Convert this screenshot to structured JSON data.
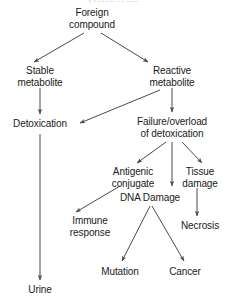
{
  "diagram": {
    "title_clipped": "Metabolism",
    "line_color": "#4a4a4a",
    "text_color": "#1a1a1a",
    "background": "#ffffff",
    "nodes": [
      {
        "id": "foreign-compound",
        "label": "Foreign\ncompound",
        "x": 92,
        "y": 18
      },
      {
        "id": "stable-metabolite",
        "label": "Stable\nmetabolite",
        "x": 40,
        "y": 76
      },
      {
        "id": "reactive-metabolite",
        "label": "Reactive\nmetabolite",
        "x": 172,
        "y": 76
      },
      {
        "id": "detoxication",
        "label": "Detoxication",
        "x": 40,
        "y": 124
      },
      {
        "id": "failure-overload",
        "label": "Failure/overload\nof detoxication",
        "x": 172,
        "y": 127
      },
      {
        "id": "antigenic-conjugate",
        "label": "Antigenic\nconjugate",
        "x": 133,
        "y": 177
      },
      {
        "id": "tissue-damage",
        "label": "Tissue\ndamage",
        "x": 200,
        "y": 177
      },
      {
        "id": "dna-damage",
        "label": "DNA Damage",
        "x": 150,
        "y": 198
      },
      {
        "id": "immune-response",
        "label": "Immune\nresponse",
        "x": 90,
        "y": 226
      },
      {
        "id": "necrosis",
        "label": "Necrosis",
        "x": 200,
        "y": 226
      },
      {
        "id": "mutation",
        "label": "Mutation",
        "x": 120,
        "y": 272
      },
      {
        "id": "cancer",
        "label": "Cancer",
        "x": 185,
        "y": 272
      },
      {
        "id": "urine",
        "label": "Urine",
        "x": 40,
        "y": 290
      }
    ],
    "edges": [
      {
        "id": "foreign-to-stable",
        "from": "foreign-compound",
        "to": "stable-metabolite",
        "x1": 84,
        "y1": 33,
        "x2": 34,
        "y2": 62
      },
      {
        "id": "foreign-to-reactive",
        "from": "foreign-compound",
        "to": "reactive-metabolite",
        "x1": 101,
        "y1": 33,
        "x2": 148,
        "y2": 62
      },
      {
        "id": "stable-to-detoxication",
        "from": "stable-metabolite",
        "to": "detoxication",
        "x1": 40,
        "y1": 88,
        "x2": 40,
        "y2": 114
      },
      {
        "id": "reactive-to-failure",
        "from": "reactive-metabolite",
        "to": "failure-overload",
        "x1": 172,
        "y1": 88,
        "x2": 172,
        "y2": 112
      },
      {
        "id": "reactive-to-detoxication",
        "from": "reactive-metabolite",
        "to": "detoxication",
        "x1": 160,
        "y1": 90,
        "x2": 80,
        "y2": 123
      },
      {
        "id": "detoxication-to-urine",
        "from": "detoxication",
        "to": "urine",
        "x1": 40,
        "y1": 134,
        "x2": 40,
        "y2": 280
      },
      {
        "id": "failure-to-antigenic",
        "from": "failure-overload",
        "to": "antigenic-conjugate",
        "x1": 166,
        "y1": 142,
        "x2": 137,
        "y2": 163
      },
      {
        "id": "failure-to-dna",
        "from": "failure-overload",
        "to": "dna-damage",
        "x1": 172,
        "y1": 142,
        "x2": 172,
        "y2": 186
      },
      {
        "id": "failure-to-tissue",
        "from": "failure-overload",
        "to": "tissue-damage",
        "x1": 182,
        "y1": 142,
        "x2": 202,
        "y2": 163
      },
      {
        "id": "antigenic-to-immune",
        "from": "antigenic-conjugate",
        "to": "immune-response",
        "x1": 120,
        "y1": 186,
        "x2": 76,
        "y2": 212
      },
      {
        "id": "tissue-to-necrosis",
        "from": "tissue-damage",
        "to": "necrosis",
        "x1": 197,
        "y1": 188,
        "x2": 197,
        "y2": 216
      },
      {
        "id": "dna-to-mutation",
        "from": "dna-damage",
        "to": "mutation",
        "x1": 150,
        "y1": 206,
        "x2": 122,
        "y2": 261
      },
      {
        "id": "dna-to-cancer",
        "from": "dna-damage",
        "to": "cancer",
        "x1": 152,
        "y1": 206,
        "x2": 184,
        "y2": 261
      }
    ]
  }
}
